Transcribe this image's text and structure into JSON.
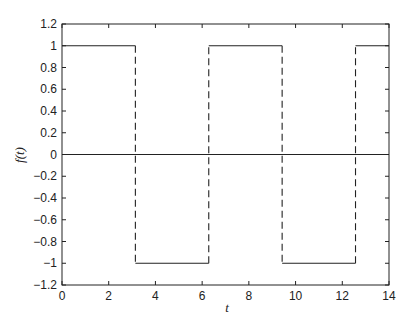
{
  "chart_data": {
    "type": "line",
    "title": "",
    "xlabel": "t",
    "ylabel": "f(t)",
    "xlim": [
      0,
      14
    ],
    "ylim": [
      -1.2,
      1.2
    ],
    "grid": false,
    "legend": null,
    "xticks": [
      "0",
      "2",
      "4",
      "6",
      "8",
      "10",
      "12",
      "14"
    ],
    "yticks": [
      "1.2",
      "1",
      "0.8",
      "0.6",
      "0.4",
      "0.2",
      "0",
      "-0.2",
      "-0.4",
      "-0.6",
      "-0.8",
      "-1",
      "-1.2"
    ],
    "series": [
      {
        "name": "square wave f(t)",
        "style": "solid horizontal segments, dashed vertical transitions",
        "x": [
          0,
          3.1416,
          3.1416,
          6.2832,
          6.2832,
          9.4248,
          9.4248,
          12.5664,
          12.5664,
          14
        ],
        "y": [
          1,
          1,
          -1,
          -1,
          1,
          1,
          -1,
          -1,
          1,
          1
        ]
      },
      {
        "name": "zero line",
        "style": "solid",
        "x": [
          0,
          14
        ],
        "y": [
          0,
          0
        ]
      }
    ],
    "line_color": "#222222"
  }
}
